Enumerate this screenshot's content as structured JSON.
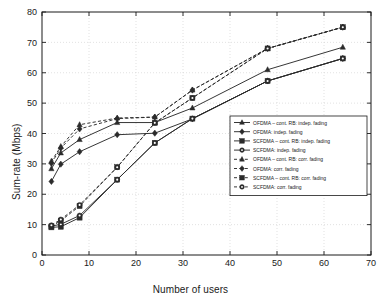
{
  "chart_data": {
    "type": "line",
    "title": "",
    "xlabel": "Number of users",
    "ylabel": "Sum-rate (Mbps)",
    "xlim": [
      0,
      70
    ],
    "ylim": [
      0,
      80
    ],
    "xticks": [
      0,
      10,
      20,
      30,
      40,
      50,
      60,
      70
    ],
    "yticks": [
      0,
      10,
      20,
      30,
      40,
      50,
      60,
      70,
      80
    ],
    "grid": true,
    "legend_position": "center-right",
    "x": [
      2,
      4,
      8,
      16,
      24,
      32,
      48,
      64
    ],
    "series": [
      {
        "name": "OFDMA – cont. RB: indep. fading",
        "linestyle": "solid",
        "marker": "triangle",
        "color": "#2b2b2b",
        "values": [
          28.4,
          33.6,
          38.0,
          43.6,
          43.6,
          48.4,
          61.0,
          68.4
        ]
      },
      {
        "name": "OFDMA: indep. fading",
        "linestyle": "solid",
        "marker": "diamond",
        "color": "#2b2b2b",
        "values": [
          24.2,
          29.9,
          34.0,
          39.6,
          40.1,
          44.8,
          57.3,
          64.7
        ]
      },
      {
        "name": "SCFDMA – cont. RB: indep. fading",
        "linestyle": "solid",
        "marker": "square",
        "color": "#2b2b2b",
        "values": [
          9.1,
          9.3,
          12.3,
          24.8,
          36.9,
          44.9,
          57.3,
          64.7
        ]
      },
      {
        "name": "SCFDMA: indep. fading",
        "linestyle": "solid",
        "marker": "circle",
        "color": "#2b2b2b",
        "values": [
          9.5,
          10.1,
          13.0,
          24.8,
          36.9,
          44.9,
          57.3,
          64.7
        ]
      },
      {
        "name": "OFDMA – cont. RB: corr. fading",
        "linestyle": "dashed",
        "marker": "triangle",
        "color": "#2b2b2b",
        "values": [
          30.9,
          35.7,
          42.9,
          45.1,
          45.4,
          54.3,
          68.0,
          75.0
        ]
      },
      {
        "name": "OFDMA: corr. fading",
        "linestyle": "dashed",
        "marker": "diamond",
        "color": "#2b2b2b",
        "values": [
          30.2,
          35.2,
          41.5,
          44.9,
          45.4,
          54.3,
          68.0,
          75.0
        ]
      },
      {
        "name": "SCFDMA – cont. RB: corr. fading",
        "linestyle": "dashed",
        "marker": "square",
        "color": "#2b2b2b",
        "values": [
          9.4,
          11.3,
          16.1,
          28.9,
          43.5,
          51.7,
          68.0,
          75.0
        ]
      },
      {
        "name": "SCFDMA: corr. fading",
        "linestyle": "dashed",
        "marker": "circle",
        "color": "#2b2b2b",
        "values": [
          9.8,
          11.7,
          16.5,
          28.9,
          43.5,
          51.7,
          68.0,
          75.0
        ]
      }
    ]
  },
  "axes": {
    "xlabel": "Number of users",
    "ylabel": "Sum-rate (Mbps)"
  }
}
